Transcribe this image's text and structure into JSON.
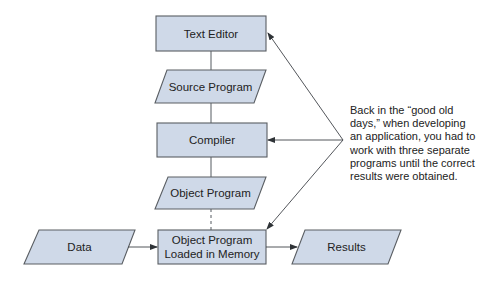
{
  "diagram": {
    "nodes": {
      "text_editor": {
        "label": "Text Editor",
        "shape": "rectangle"
      },
      "source_program": {
        "label": "Source Program",
        "shape": "parallelogram"
      },
      "compiler": {
        "label": "Compiler",
        "shape": "rectangle"
      },
      "object_program": {
        "label": "Object Program",
        "shape": "parallelogram"
      },
      "data": {
        "label": "Data",
        "shape": "parallelogram"
      },
      "memory": {
        "label_line1": "Object Program",
        "label_line2": "Loaded in Memory",
        "shape": "rectangle"
      },
      "results": {
        "label": "Results",
        "shape": "parallelogram"
      }
    },
    "annotation": {
      "lines": [
        "Back in the “good old",
        "days,” when developing",
        "an application, you had to",
        "work with three separate",
        "programs until the correct",
        "results were obtained."
      ]
    },
    "colors": {
      "node_fill": "#cfd9e8",
      "node_stroke": "#5a5e63",
      "text": "#222222"
    }
  }
}
